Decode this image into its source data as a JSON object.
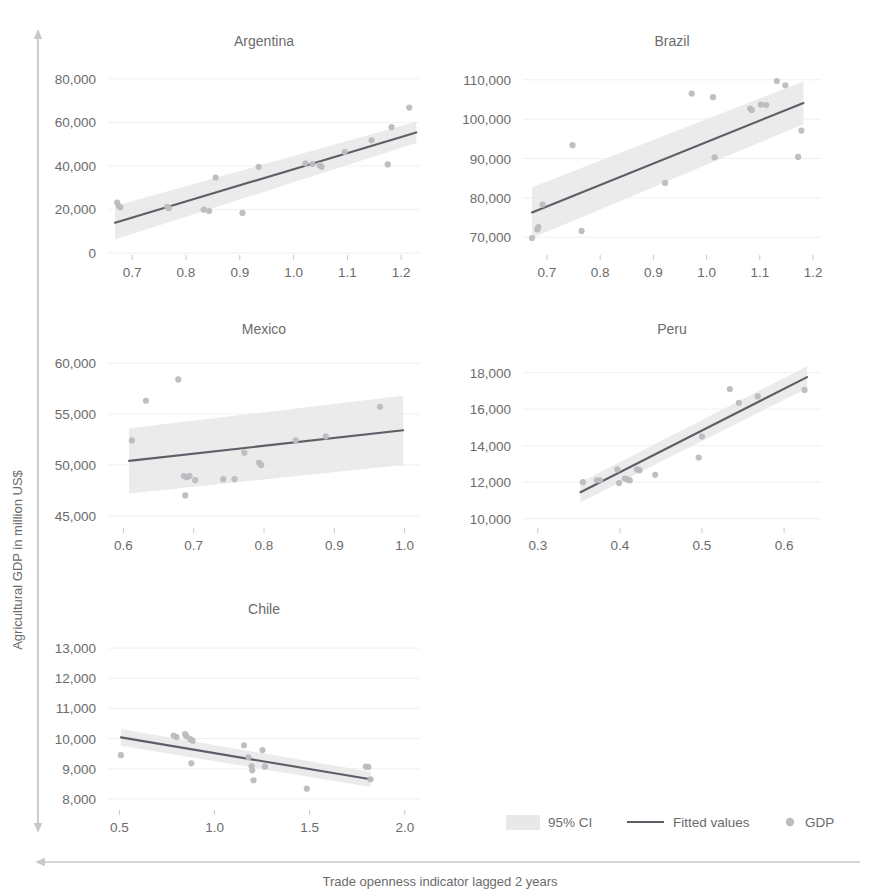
{
  "figure": {
    "y_axis_title": "Agricultural GDP in million US$",
    "x_axis_title": "Trade openness indicator lagged 2 years",
    "colors": {
      "fitted_line": "#5b5f66",
      "ci_band": "#e8e8e8",
      "points": "#b9bcc0",
      "axis": "#c8c8c8",
      "text": "#6b6b6b",
      "grid": "#f0f0f0",
      "background": "#ffffff"
    }
  },
  "legend": {
    "position": "bottom-right",
    "items": [
      {
        "label": "95% CI",
        "marker": "band-swatch"
      },
      {
        "label": "Fitted values",
        "marker": "line"
      },
      {
        "label": "GDP",
        "marker": "circle"
      }
    ]
  },
  "chart_data": [
    {
      "type": "scatter",
      "title": "Argentina",
      "xlabel": "Trade openness indicator lagged 2 years",
      "ylabel": "Agricultural GDP in million US$",
      "grid": true,
      "xlim": [
        0.655,
        1.235
      ],
      "ylim": [
        0,
        85000
      ],
      "xticks": [
        0.7,
        0.8,
        0.9,
        1.0,
        1.1,
        1.2
      ],
      "xtick_labels": [
        "0.7",
        "0.8",
        "0.9",
        "1.0",
        "1.1",
        "1.2"
      ],
      "yticks": [
        0,
        20000,
        40000,
        60000,
        80000
      ],
      "ytick_labels": [
        "0",
        "20,000",
        "40,000",
        "60,000",
        "80,000"
      ],
      "series": [
        {
          "name": "GDP",
          "points": [
            [
              0.672,
              23200
            ],
            [
              0.675,
              21600
            ],
            [
              0.678,
              21000
            ],
            [
              0.765,
              21200
            ],
            [
              0.768,
              20600
            ],
            [
              0.833,
              19900
            ],
            [
              0.843,
              19300
            ],
            [
              0.855,
              34700
            ],
            [
              0.905,
              18400
            ],
            [
              0.935,
              39600
            ],
            [
              1.022,
              41200
            ],
            [
              1.035,
              40900
            ],
            [
              1.048,
              40400
            ],
            [
              1.052,
              39600
            ],
            [
              1.095,
              46400
            ],
            [
              1.145,
              51800
            ],
            [
              1.175,
              40700
            ],
            [
              1.182,
              57800
            ],
            [
              1.215,
              66800
            ]
          ]
        }
      ],
      "fit": {
        "name": "Fitted values",
        "x": [
          0.668,
          1.228
        ],
        "y": [
          13900,
          55400
        ]
      },
      "ci": {
        "name": "95% CI",
        "x": [
          0.668,
          1.228
        ],
        "lower": [
          6200,
          50500
        ],
        "upper": [
          21600,
          60300
        ]
      }
    },
    {
      "type": "scatter",
      "title": "Brazil",
      "xlabel": "Trade openness indicator lagged 2 years",
      "ylabel": "Agricultural GDP in million US$",
      "grid": true,
      "xlim": [
        0.655,
        1.215
      ],
      "ylim": [
        66000,
        113000
      ],
      "xticks": [
        0.7,
        0.8,
        0.9,
        1.0,
        1.1,
        1.2
      ],
      "xtick_labels": [
        "0.7",
        "0.8",
        "0.9",
        "1.0",
        "1.1",
        "1.2"
      ],
      "yticks": [
        70000,
        80000,
        90000,
        100000,
        110000
      ],
      "ytick_labels": [
        "70,000",
        "80,000",
        "90,000",
        "100,000",
        "110,000"
      ],
      "series": [
        {
          "name": "GDP",
          "points": [
            [
              0.672,
              69800
            ],
            [
              0.682,
              72000
            ],
            [
              0.684,
              72600
            ],
            [
              0.692,
              78300
            ],
            [
              0.748,
              93400
            ],
            [
              0.765,
              71600
            ],
            [
              0.922,
              83800
            ],
            [
              0.972,
              106500
            ],
            [
              1.012,
              105600
            ],
            [
              1.015,
              90300
            ],
            [
              1.082,
              102700
            ],
            [
              1.085,
              102300
            ],
            [
              1.102,
              103700
            ],
            [
              1.112,
              103600
            ],
            [
              1.132,
              109700
            ],
            [
              1.148,
              108600
            ],
            [
              1.172,
              90400
            ],
            [
              1.178,
              97100
            ]
          ]
        }
      ],
      "fit": {
        "name": "Fitted values",
        "x": [
          0.672,
          1.182
        ],
        "y": [
          76300,
          104100
        ]
      },
      "ci": {
        "name": "95% CI",
        "x": [
          0.672,
          1.182
        ],
        "lower": [
          69800,
          98700
        ],
        "upper": [
          82700,
          109600
        ]
      }
    },
    {
      "type": "scatter",
      "title": "Mexico",
      "xlabel": "Trade openness indicator lagged 2 years",
      "ylabel": "Agricultural GDP in million US$",
      "grid": true,
      "xlim": [
        0.578,
        1.022
      ],
      "ylim": [
        44000,
        60500
      ],
      "xticks": [
        0.6,
        0.7,
        0.8,
        0.9,
        1.0
      ],
      "xtick_labels": [
        "0.6",
        "0.7",
        "0.8",
        "0.9",
        "1.0"
      ],
      "yticks": [
        45000,
        50000,
        55000,
        60000
      ],
      "ytick_labels": [
        "45,000",
        "50,000",
        "55,000",
        "60,000"
      ],
      "series": [
        {
          "name": "GDP",
          "points": [
            [
              0.612,
              52400
            ],
            [
              0.632,
              56300
            ],
            [
              0.678,
              58400
            ],
            [
              0.686,
              48900
            ],
            [
              0.69,
              48800
            ],
            [
              0.694,
              48900
            ],
            [
              0.688,
              47000
            ],
            [
              0.702,
              48500
            ],
            [
              0.742,
              48600
            ],
            [
              0.758,
              48600
            ],
            [
              0.772,
              51200
            ],
            [
              0.793,
              50200
            ],
            [
              0.796,
              50000
            ],
            [
              0.845,
              52400
            ],
            [
              0.888,
              52800
            ],
            [
              0.965,
              55700
            ]
          ]
        }
      ],
      "fit": {
        "name": "Fitted values",
        "x": [
          0.608,
          0.998
        ],
        "y": [
          50400,
          53400
        ]
      },
      "ci": {
        "name": "95% CI",
        "x": [
          0.608,
          0.998
        ],
        "lower": [
          47200,
          50000
        ],
        "upper": [
          53600,
          56800
        ]
      }
    },
    {
      "type": "scatter",
      "title": "Peru",
      "xlabel": "Trade openness indicator lagged 2 years",
      "ylabel": "Agricultural GDP in million US$",
      "grid": true,
      "xlim": [
        0.282,
        0.645
      ],
      "ylim": [
        9600,
        18800
      ],
      "xticks": [
        0.3,
        0.4,
        0.5,
        0.6
      ],
      "xtick_labels": [
        "0.3",
        "0.4",
        "0.5",
        "0.6"
      ],
      "yticks": [
        10000,
        12000,
        14000,
        16000,
        18000
      ],
      "ytick_labels": [
        "10,000",
        "12,000",
        "14,000",
        "16,000",
        "18,000"
      ],
      "series": [
        {
          "name": "GDP",
          "points": [
            [
              0.355,
              12000
            ],
            [
              0.372,
              12100
            ],
            [
              0.376,
              12100
            ],
            [
              0.397,
              12700
            ],
            [
              0.399,
              11950
            ],
            [
              0.406,
              12200
            ],
            [
              0.409,
              12150
            ],
            [
              0.412,
              12100
            ],
            [
              0.421,
              12700
            ],
            [
              0.424,
              12650
            ],
            [
              0.443,
              12400
            ],
            [
              0.496,
              13350
            ],
            [
              0.5,
              14500
            ],
            [
              0.534,
              17100
            ],
            [
              0.545,
              16350
            ],
            [
              0.568,
              16700
            ],
            [
              0.625,
              17050
            ]
          ]
        }
      ],
      "fit": {
        "name": "Fitted values",
        "x": [
          0.352,
          0.628
        ],
        "y": [
          11450,
          17750
        ]
      },
      "ci": {
        "name": "95% CI",
        "x": [
          0.352,
          0.628
        ],
        "lower": [
          10900,
          17150
        ],
        "upper": [
          12000,
          18350
        ]
      }
    },
    {
      "type": "scatter",
      "title": "Chile",
      "xlabel": "Trade openness indicator lagged 2 years",
      "ylabel": "Agricultural GDP in million US$",
      "grid": true,
      "xlim": [
        0.44,
        2.08
      ],
      "ylim": [
        7700,
        13400
      ],
      "xticks": [
        0.5,
        1.0,
        1.5,
        2.0
      ],
      "xtick_labels": [
        "0.5",
        "1.0",
        "1.5",
        "2.0"
      ],
      "yticks": [
        8000,
        9000,
        10000,
        11000,
        12000,
        13000
      ],
      "ytick_labels": [
        "8,000",
        "9,000",
        "10,000",
        "11,000",
        "12,000",
        "13,000"
      ],
      "series": [
        {
          "name": "GDP",
          "points": [
            [
              0.508,
              9450
            ],
            [
              0.785,
              10100
            ],
            [
              0.8,
              10050
            ],
            [
              0.845,
              10150
            ],
            [
              0.852,
              10080
            ],
            [
              0.872,
              9980
            ],
            [
              0.885,
              9930
            ],
            [
              0.878,
              9180
            ],
            [
              1.155,
              9780
            ],
            [
              1.178,
              9380
            ],
            [
              1.195,
              9080
            ],
            [
              1.198,
              8950
            ],
            [
              1.205,
              8620
            ],
            [
              1.252,
              9620
            ],
            [
              1.265,
              9070
            ],
            [
              1.485,
              8340
            ],
            [
              1.795,
              9070
            ],
            [
              1.808,
              9060
            ],
            [
              1.82,
              8650
            ]
          ]
        }
      ],
      "fit": {
        "name": "Fitted values",
        "x": [
          0.508,
          1.82
        ],
        "y": [
          10040,
          8650
        ]
      },
      "ci": {
        "name": "95% CI",
        "x": [
          0.508,
          1.82
        ],
        "lower": [
          9760,
          8400
        ],
        "upper": [
          10320,
          8900
        ]
      }
    }
  ]
}
